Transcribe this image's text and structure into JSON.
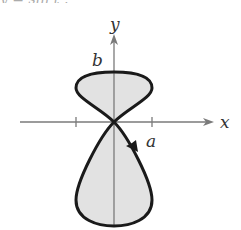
{
  "figure": {
    "top_partial_text": "y = sin t ,",
    "axes": {
      "x_label": "x",
      "y_label": "y"
    },
    "curve_labels": {
      "top": "b",
      "right": "a"
    },
    "colors": {
      "axis": "#7a7a7a",
      "curve": "#1a1a1a",
      "fill": "#e2e2e2"
    }
  }
}
